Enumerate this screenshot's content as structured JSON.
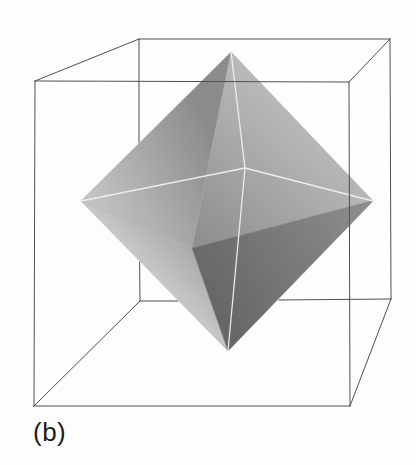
{
  "figure": {
    "label": "(b)"
  },
  "colors": {
    "background": "#fdfdfd",
    "cube_edge": "#4f4f4f",
    "hidden_edge": "#f1f1f1",
    "label": "#1b1b1b",
    "octahedron": {
      "upper_left_start": "#8c8c8c",
      "upper_left_end": "#c9c9c9",
      "upper_right_start": "#b9b9b9",
      "upper_right_end": "#8d8d8d",
      "lower_left_start": "#c9c9c9",
      "lower_left_end": "#9c9c9c",
      "lower_right_start": "#8f8f8f",
      "lower_right_end": "#676767"
    }
  }
}
